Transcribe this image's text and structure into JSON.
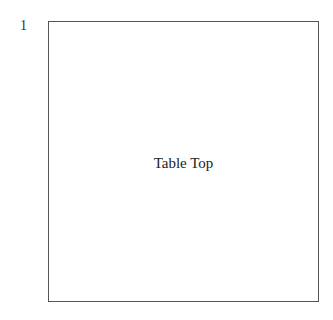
{
  "page": {
    "number": "1"
  },
  "diagram": {
    "shape": {
      "label": "Table Top",
      "type": "rectangle",
      "border_color": "#555555"
    }
  }
}
